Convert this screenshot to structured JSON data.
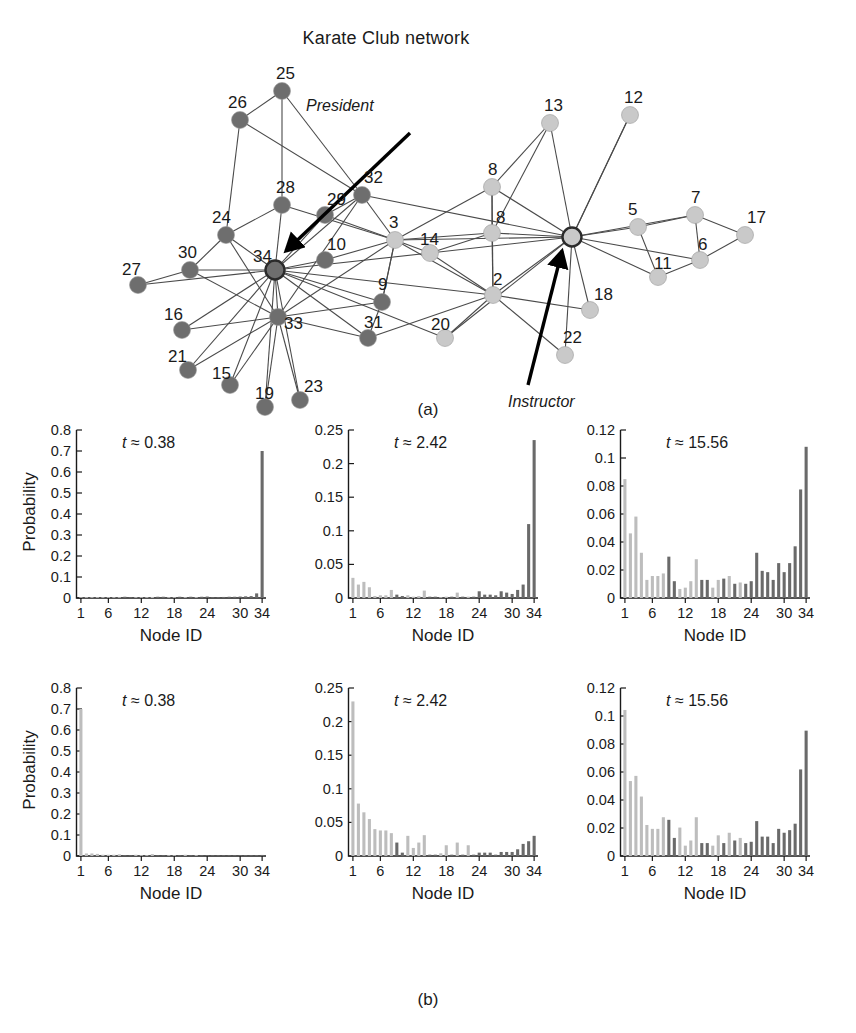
{
  "figure": {
    "title": "Karate Club network",
    "panel_a_label": "(a)",
    "panel_b_label": "(b)"
  },
  "network": {
    "name": "karate-club-network",
    "role_annotations": [
      {
        "text": "President",
        "target_node": 34
      },
      {
        "text": "Instructor",
        "target_node": 1
      }
    ],
    "community_colors": {
      "president_group": "#6e6e6e",
      "instructor_group": "#c9c9c9",
      "hub_outline": "#2b2b2b"
    },
    "nodes": [
      {
        "id": 25,
        "label": "25",
        "x": 172,
        "y": 36,
        "group": "president"
      },
      {
        "id": 26,
        "label": "26",
        "x": 130,
        "y": 65,
        "group": "president"
      },
      {
        "id": 28,
        "label": "28",
        "x": 172,
        "y": 150,
        "group": "president"
      },
      {
        "id": 29,
        "label": "29",
        "x": 215,
        "y": 160,
        "group": "president"
      },
      {
        "id": 32,
        "label": "32",
        "x": 252,
        "y": 140,
        "group": "president"
      },
      {
        "id": 24,
        "label": "24",
        "x": 116,
        "y": 180,
        "group": "president"
      },
      {
        "id": 10,
        "label": "10",
        "x": 215,
        "y": 205,
        "group": "president"
      },
      {
        "id": 27,
        "label": "27",
        "x": 28,
        "y": 230,
        "group": "president"
      },
      {
        "id": 30,
        "label": "30",
        "x": 80,
        "y": 215,
        "group": "president"
      },
      {
        "id": 34,
        "label": "34",
        "x": 165,
        "y": 215,
        "group": "president",
        "hub": true
      },
      {
        "id": 16,
        "label": "16",
        "x": 72,
        "y": 275,
        "group": "president"
      },
      {
        "id": 21,
        "label": "21",
        "x": 78,
        "y": 315,
        "group": "president"
      },
      {
        "id": 33,
        "label": "33",
        "x": 168,
        "y": 262,
        "group": "president"
      },
      {
        "id": 15,
        "label": "15",
        "x": 120,
        "y": 330,
        "group": "president"
      },
      {
        "id": 19,
        "label": "19",
        "x": 155,
        "y": 352,
        "group": "president"
      },
      {
        "id": 23,
        "label": "23",
        "x": 190,
        "y": 345,
        "group": "president"
      },
      {
        "id": 31,
        "label": "31",
        "x": 258,
        "y": 283,
        "group": "president"
      },
      {
        "id": 9,
        "label": "9",
        "x": 272,
        "y": 247,
        "group": "president"
      },
      {
        "id": 3,
        "label": "3",
        "x": 285,
        "y": 185,
        "group": "instructor"
      },
      {
        "id": 14,
        "label": "14",
        "x": 320,
        "y": 198,
        "group": "instructor"
      },
      {
        "id": 8,
        "label": "8",
        "x": 382,
        "y": 132,
        "group": "instructor"
      },
      {
        "id": 4,
        "label": "8",
        "x": 382,
        "y": 178,
        "group": "instructor"
      },
      {
        "id": 20,
        "label": "20",
        "x": 335,
        "y": 283,
        "group": "instructor"
      },
      {
        "id": 2,
        "label": "2",
        "x": 383,
        "y": 240,
        "group": "instructor"
      },
      {
        "id": 13,
        "label": "13",
        "x": 440,
        "y": 68,
        "group": "instructor"
      },
      {
        "id": 12,
        "label": "12",
        "x": 520,
        "y": 60,
        "group": "instructor"
      },
      {
        "id": 1,
        "label": "",
        "x": 462,
        "y": 182,
        "group": "instructor",
        "hub": true
      },
      {
        "id": 18,
        "label": "18",
        "x": 480,
        "y": 255,
        "group": "instructor"
      },
      {
        "id": 22,
        "label": "22",
        "x": 455,
        "y": 300,
        "group": "instructor"
      },
      {
        "id": 5,
        "label": "5",
        "x": 528,
        "y": 172,
        "group": "instructor"
      },
      {
        "id": 11,
        "label": "11",
        "x": 548,
        "y": 222,
        "group": "instructor"
      },
      {
        "id": 7,
        "label": "7",
        "x": 585,
        "y": 160,
        "group": "instructor"
      },
      {
        "id": 6,
        "label": "6",
        "x": 590,
        "y": 205,
        "group": "instructor"
      },
      {
        "id": 17,
        "label": "17",
        "x": 635,
        "y": 180,
        "group": "instructor"
      }
    ]
  },
  "chart_data": [
    {
      "id": "top-left",
      "type": "bar",
      "title": "",
      "annotation": "t ≈ 0.38",
      "t": 0.38,
      "xlabel": "Node ID",
      "ylabel": "Probability",
      "ylim": [
        0,
        0.8
      ],
      "yticks": [
        "0",
        "0.1",
        "0.2",
        "0.3",
        "0.4",
        "0.5",
        "0.6",
        "0.7",
        "0.8"
      ],
      "xticks": [
        "1",
        "6",
        "12",
        "18",
        "24",
        "30",
        "34"
      ],
      "xtick_nodes": [
        1,
        6,
        12,
        18,
        24,
        30,
        34
      ],
      "categories": [
        1,
        2,
        3,
        4,
        5,
        6,
        7,
        8,
        9,
        10,
        11,
        12,
        13,
        14,
        15,
        16,
        17,
        18,
        19,
        20,
        21,
        22,
        23,
        24,
        25,
        26,
        27,
        28,
        29,
        30,
        31,
        32,
        33,
        34
      ],
      "values": [
        0.0,
        0.0,
        0.002,
        0.0,
        0.0,
        0.0,
        0.0,
        0.003,
        0.006,
        0.003,
        0.0,
        0.0,
        0.0,
        0.005,
        0.006,
        0.006,
        0.0,
        0.004,
        0.006,
        0.004,
        0.006,
        0.004,
        0.006,
        0.007,
        0.004,
        0.004,
        0.005,
        0.006,
        0.006,
        0.007,
        0.008,
        0.009,
        0.022,
        0.7
      ],
      "group_colors": {
        "instructor_group": "#bdbdbd",
        "president_group": "#6a6a6a"
      },
      "groups": [
        "i",
        "i",
        "i",
        "i",
        "i",
        "i",
        "i",
        "i",
        "p",
        "p",
        "i",
        "i",
        "i",
        "i",
        "p",
        "p",
        "i",
        "i",
        "p",
        "i",
        "p",
        "i",
        "p",
        "p",
        "p",
        "p",
        "p",
        "p",
        "p",
        "p",
        "p",
        "p",
        "p",
        "p"
      ]
    },
    {
      "id": "top-middle",
      "type": "bar",
      "annotation": "t ≈ 2.42",
      "t": 2.42,
      "xlabel": "Node ID",
      "ylabel": "",
      "ylim": [
        0,
        0.25
      ],
      "yticks": [
        "0",
        "0.05",
        "0.1",
        "0.15",
        "0.2",
        "0.25"
      ],
      "xticks": [
        "1",
        "6",
        "12",
        "18",
        "24",
        "30",
        "34"
      ],
      "xtick_nodes": [
        1,
        6,
        12,
        18,
        24,
        30,
        34
      ],
      "categories": [
        1,
        2,
        3,
        4,
        5,
        6,
        7,
        8,
        9,
        10,
        11,
        12,
        13,
        14,
        15,
        16,
        17,
        18,
        19,
        20,
        21,
        22,
        23,
        24,
        25,
        26,
        27,
        28,
        29,
        30,
        31,
        32,
        33,
        34
      ],
      "values": [
        0.03,
        0.02,
        0.024,
        0.016,
        0.003,
        0.004,
        0.004,
        0.012,
        0.005,
        0.003,
        0.004,
        0.002,
        0.003,
        0.011,
        0.002,
        0.002,
        0.001,
        0.002,
        0.002,
        0.008,
        0.002,
        0.002,
        0.002,
        0.01,
        0.005,
        0.005,
        0.004,
        0.01,
        0.008,
        0.006,
        0.012,
        0.02,
        0.11,
        0.235
      ],
      "group_colors": {
        "instructor_group": "#bdbdbd",
        "president_group": "#6a6a6a"
      },
      "groups": [
        "i",
        "i",
        "i",
        "i",
        "i",
        "i",
        "i",
        "i",
        "p",
        "p",
        "i",
        "i",
        "i",
        "i",
        "p",
        "p",
        "i",
        "i",
        "p",
        "i",
        "p",
        "i",
        "p",
        "p",
        "p",
        "p",
        "p",
        "p",
        "p",
        "p",
        "p",
        "p",
        "p",
        "p"
      ]
    },
    {
      "id": "top-right",
      "type": "bar",
      "annotation": "t ≈ 15.56",
      "t": 15.56,
      "xlabel": "Node ID",
      "ylabel": "",
      "ylim": [
        0,
        0.13
      ],
      "yticks": [
        "0",
        "0.02",
        "0.04",
        "0.06",
        "0.08",
        "0.1",
        "0.12"
      ],
      "xticks": [
        "1",
        "6",
        "12",
        "18",
        "24",
        "30",
        "34"
      ],
      "xtick_nodes": [
        1,
        6,
        12,
        18,
        24,
        30,
        34
      ],
      "categories": [
        1,
        2,
        3,
        4,
        5,
        6,
        7,
        8,
        9,
        10,
        11,
        12,
        13,
        14,
        15,
        16,
        17,
        18,
        19,
        20,
        21,
        22,
        23,
        24,
        25,
        26,
        27,
        28,
        29,
        30,
        31,
        32,
        33,
        34
      ],
      "values": [
        0.092,
        0.05,
        0.063,
        0.035,
        0.014,
        0.017,
        0.017,
        0.019,
        0.032,
        0.013,
        0.007,
        0.008,
        0.013,
        0.03,
        0.014,
        0.014,
        0.008,
        0.014,
        0.015,
        0.017,
        0.011,
        0.012,
        0.011,
        0.013,
        0.035,
        0.021,
        0.02,
        0.014,
        0.027,
        0.02,
        0.027,
        0.04,
        0.084,
        0.117
      ],
      "group_colors": {
        "instructor_group": "#bdbdbd",
        "president_group": "#6a6a6a"
      },
      "groups": [
        "i",
        "i",
        "i",
        "i",
        "i",
        "i",
        "i",
        "i",
        "p",
        "p",
        "i",
        "i",
        "i",
        "i",
        "p",
        "p",
        "i",
        "i",
        "p",
        "i",
        "p",
        "i",
        "p",
        "p",
        "p",
        "p",
        "p",
        "p",
        "p",
        "p",
        "p",
        "p",
        "p",
        "p"
      ]
    },
    {
      "id": "bottom-left",
      "type": "bar",
      "annotation": "t ≈ 0.38",
      "t": 0.38,
      "xlabel": "Node ID",
      "ylabel": "Probability",
      "ylim": [
        0,
        0.8
      ],
      "yticks": [
        "0",
        "0.1",
        "0.2",
        "0.3",
        "0.4",
        "0.5",
        "0.6",
        "0.7",
        "0.8"
      ],
      "xticks": [
        "1",
        "6",
        "12",
        "18",
        "24",
        "30",
        "34"
      ],
      "xtick_nodes": [
        1,
        6,
        12,
        18,
        24,
        30,
        34
      ],
      "categories": [
        1,
        2,
        3,
        4,
        5,
        6,
        7,
        8,
        9,
        10,
        11,
        12,
        13,
        14,
        15,
        16,
        17,
        18,
        19,
        20,
        21,
        22,
        23,
        24,
        25,
        26,
        27,
        28,
        29,
        30,
        31,
        32,
        33,
        34
      ],
      "values": [
        0.7,
        0.012,
        0.012,
        0.01,
        0.006,
        0.006,
        0.006,
        0.008,
        0.004,
        0.002,
        0.006,
        0.004,
        0.004,
        0.009,
        0.002,
        0.002,
        0.002,
        0.004,
        0.002,
        0.006,
        0.002,
        0.004,
        0.002,
        0.002,
        0.002,
        0.002,
        0.001,
        0.002,
        0.002,
        0.002,
        0.002,
        0.003,
        0.004,
        0.005
      ],
      "group_colors": {
        "instructor_group": "#bdbdbd",
        "president_group": "#6a6a6a"
      },
      "groups": [
        "i",
        "i",
        "i",
        "i",
        "i",
        "i",
        "i",
        "i",
        "p",
        "p",
        "i",
        "i",
        "i",
        "i",
        "p",
        "p",
        "i",
        "i",
        "p",
        "i",
        "p",
        "i",
        "p",
        "p",
        "p",
        "p",
        "p",
        "p",
        "p",
        "p",
        "p",
        "p",
        "p",
        "p"
      ]
    },
    {
      "id": "bottom-middle",
      "type": "bar",
      "annotation": "t ≈ 2.42",
      "t": 2.42,
      "xlabel": "Node ID",
      "ylabel": "",
      "ylim": [
        0,
        0.25
      ],
      "yticks": [
        "0",
        "0.05",
        "0.1",
        "0.15",
        "0.2",
        "0.25"
      ],
      "xticks": [
        "1",
        "6",
        "12",
        "18",
        "24",
        "30",
        "34"
      ],
      "xtick_nodes": [
        1,
        6,
        12,
        18,
        24,
        30,
        34
      ],
      "categories": [
        1,
        2,
        3,
        4,
        5,
        6,
        7,
        8,
        9,
        10,
        11,
        12,
        13,
        14,
        15,
        16,
        17,
        18,
        19,
        20,
        21,
        22,
        23,
        24,
        25,
        26,
        27,
        28,
        29,
        30,
        31,
        32,
        33,
        34
      ],
      "values": [
        0.23,
        0.078,
        0.065,
        0.055,
        0.04,
        0.038,
        0.038,
        0.034,
        0.02,
        0.005,
        0.03,
        0.012,
        0.02,
        0.031,
        0.002,
        0.002,
        0.004,
        0.016,
        0.002,
        0.02,
        0.002,
        0.016,
        0.002,
        0.005,
        0.005,
        0.005,
        0.002,
        0.006,
        0.006,
        0.006,
        0.01,
        0.018,
        0.022,
        0.03
      ],
      "group_colors": {
        "instructor_group": "#bdbdbd",
        "president_group": "#6a6a6a"
      },
      "groups": [
        "i",
        "i",
        "i",
        "i",
        "i",
        "i",
        "i",
        "i",
        "p",
        "p",
        "i",
        "i",
        "i",
        "i",
        "p",
        "p",
        "i",
        "i",
        "p",
        "i",
        "p",
        "i",
        "p",
        "p",
        "p",
        "p",
        "p",
        "p",
        "p",
        "p",
        "p",
        "p",
        "p",
        "p"
      ]
    },
    {
      "id": "bottom-right",
      "type": "bar",
      "annotation": "t ≈ 15.56",
      "t": 15.56,
      "xlabel": "Node ID",
      "ylabel": "",
      "ylim": [
        0,
        0.13
      ],
      "yticks": [
        "0",
        "0.02",
        "0.04",
        "0.06",
        "0.08",
        "0.1",
        "0.12"
      ],
      "xticks": [
        "1",
        "6",
        "12",
        "18",
        "24",
        "30",
        "34"
      ],
      "xtick_nodes": [
        1,
        6,
        12,
        18,
        24,
        30,
        34
      ],
      "categories": [
        1,
        2,
        3,
        4,
        5,
        6,
        7,
        8,
        9,
        10,
        11,
        12,
        13,
        14,
        15,
        16,
        17,
        18,
        19,
        20,
        21,
        22,
        23,
        24,
        25,
        26,
        27,
        28,
        29,
        30,
        31,
        32,
        33,
        34
      ],
      "values": [
        0.113,
        0.058,
        0.062,
        0.046,
        0.024,
        0.021,
        0.021,
        0.03,
        0.028,
        0.014,
        0.022,
        0.008,
        0.012,
        0.03,
        0.01,
        0.01,
        0.008,
        0.016,
        0.01,
        0.018,
        0.012,
        0.014,
        0.01,
        0.011,
        0.027,
        0.015,
        0.015,
        0.01,
        0.021,
        0.018,
        0.02,
        0.025,
        0.067,
        0.097
      ],
      "group_colors": {
        "instructor_group": "#bdbdbd",
        "president_group": "#6a6a6a"
      },
      "groups": [
        "i",
        "i",
        "i",
        "i",
        "i",
        "i",
        "i",
        "i",
        "p",
        "p",
        "i",
        "i",
        "i",
        "i",
        "p",
        "p",
        "i",
        "i",
        "p",
        "i",
        "p",
        "i",
        "p",
        "p",
        "p",
        "p",
        "p",
        "p",
        "p",
        "p",
        "p",
        "p",
        "p",
        "p"
      ]
    }
  ]
}
